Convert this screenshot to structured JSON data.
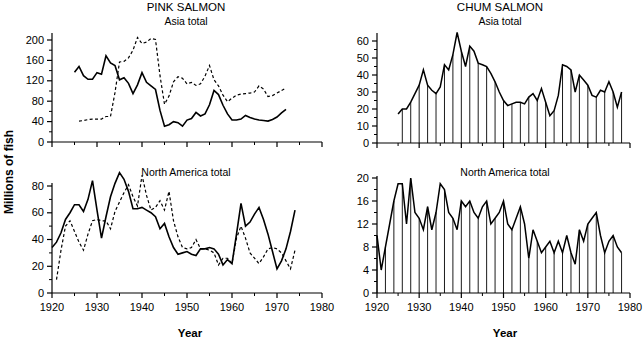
{
  "figure": {
    "ylabel": "Millions of fish",
    "xlabel_left": "Year",
    "xlabel_right": "Year"
  },
  "chart_data": [
    {
      "id": "pink-asia",
      "type": "line",
      "title": "PINK SALMON",
      "subtitle": "Asia total",
      "xlabel": "",
      "ylabel": "Millions of fish",
      "xlim": [
        1920,
        1980
      ],
      "ylim": [
        0,
        220
      ],
      "xticks": [
        1920,
        1930,
        1940,
        1950,
        1960,
        1970,
        1980
      ],
      "xticklabels": [
        "",
        "",
        "",
        "",
        "",
        "",
        ""
      ],
      "yticks": [
        0,
        40,
        80,
        120,
        160,
        200
      ],
      "yticklabels": [
        "0",
        "40",
        "80",
        "120",
        "160",
        "200"
      ],
      "minor_ticks": true,
      "grid": false,
      "legend": "none",
      "series": [
        {
          "name": "catch",
          "style": "solid",
          "x": [
            1925,
            1926,
            1927,
            1928,
            1929,
            1930,
            1931,
            1932,
            1933,
            1934,
            1935,
            1936,
            1937,
            1938,
            1939,
            1940,
            1941,
            1942,
            1943,
            1944,
            1945,
            1946,
            1947,
            1948,
            1949,
            1950,
            1951,
            1952,
            1953,
            1954,
            1955,
            1956,
            1957,
            1958,
            1959,
            1960,
            1961,
            1962,
            1963,
            1964,
            1965,
            1966,
            1967,
            1968,
            1969,
            1970,
            1971,
            1972,
            1973,
            1974,
            1975,
            1976,
            1977
          ],
          "values": [
            137,
            148,
            130,
            123,
            123,
            136,
            133,
            169,
            155,
            150,
            122,
            126,
            115,
            95,
            112,
            136,
            117,
            110,
            103,
            62,
            31,
            34,
            40,
            38,
            31,
            43,
            46,
            58,
            51,
            55,
            73,
            101,
            93,
            72,
            55,
            43,
            43,
            45,
            52,
            48,
            45,
            43,
            42,
            41,
            44,
            49,
            57,
            64,
            null,
            null,
            null,
            null,
            null
          ]
        },
        {
          "name": "escapement",
          "style": "dashed",
          "x": [
            1926,
            1927,
            1928,
            1929,
            1930,
            1931,
            1932,
            1933,
            1934,
            1935,
            1936,
            1937,
            1938,
            1939,
            1940,
            1941,
            1942,
            1943,
            1944,
            1945,
            1946,
            1947,
            1948,
            1949,
            1950,
            1951,
            1952,
            1953,
            1954,
            1955,
            1956,
            1957,
            1958,
            1959,
            1960,
            1961,
            1962,
            1963,
            1964,
            1965,
            1966,
            1967,
            1968,
            1969,
            1970,
            1971,
            1972
          ],
          "values": [
            41,
            42,
            44,
            45,
            45,
            45,
            50,
            50,
            97,
            157,
            158,
            165,
            180,
            205,
            193,
            196,
            203,
            201,
            130,
            74,
            90,
            118,
            128,
            125,
            114,
            117,
            111,
            114,
            129,
            150,
            122,
            110,
            92,
            79,
            86,
            92,
            94,
            95,
            96,
            98,
            110,
            104,
            89,
            91,
            96,
            101,
            106
          ]
        }
      ]
    },
    {
      "id": "chum-asia",
      "type": "line",
      "title": "CHUM SALMON",
      "subtitle": "Asia total",
      "xlabel": "",
      "ylabel": "Millions of fish",
      "xlim": [
        1920,
        1980
      ],
      "ylim": [
        0,
        67
      ],
      "xticks": [
        1920,
        1930,
        1940,
        1950,
        1960,
        1970,
        1980
      ],
      "xticklabels": [
        "",
        "",
        "",
        "",
        "",
        "",
        ""
      ],
      "yticks": [
        0,
        10,
        20,
        30,
        40,
        50,
        60
      ],
      "yticklabels": [
        "0",
        "10",
        "20",
        "30",
        "40",
        "50",
        "60"
      ],
      "minor_ticks": true,
      "grid": false,
      "dropline_interval": 2,
      "legend": "none",
      "series": [
        {
          "name": "catch",
          "style": "solid-droplines",
          "x": [
            1925,
            1926,
            1927,
            1928,
            1929,
            1930,
            1931,
            1932,
            1933,
            1934,
            1935,
            1936,
            1937,
            1938,
            1939,
            1940,
            1941,
            1942,
            1943,
            1944,
            1945,
            1946,
            1947,
            1948,
            1949,
            1950,
            1951,
            1952,
            1953,
            1954,
            1955,
            1956,
            1957,
            1958,
            1959,
            1960,
            1961,
            1962,
            1963,
            1964,
            1965,
            1966,
            1967,
            1968,
            1969,
            1970,
            1971,
            1972,
            1973,
            1974,
            1975,
            1976,
            1977,
            1978
          ],
          "values": [
            17,
            20,
            20,
            24,
            29,
            34,
            43,
            34,
            31,
            29,
            33,
            46,
            43,
            52,
            65,
            54,
            45,
            57,
            54,
            47,
            46,
            45,
            41,
            36,
            30,
            25,
            22,
            23,
            24,
            24,
            23,
            27,
            29,
            25,
            32,
            24,
            16,
            19,
            28,
            46,
            45,
            43,
            30,
            40,
            37,
            34,
            28,
            27,
            31,
            30,
            36,
            30,
            21,
            30
          ]
        }
      ]
    },
    {
      "id": "pink-na",
      "type": "line",
      "title": "",
      "subtitle": "North America total",
      "xlabel": "Year",
      "ylabel": "Millions of fish",
      "xlim": [
        1920,
        1980
      ],
      "ylim": [
        0,
        95
      ],
      "xticks": [
        1920,
        1930,
        1940,
        1950,
        1960,
        1970,
        1980
      ],
      "xticklabels": [
        "1920",
        "1930",
        "1940",
        "1950",
        "1960",
        "1970",
        "1980"
      ],
      "yticks": [
        0,
        20,
        40,
        60,
        80
      ],
      "yticklabels": [
        "0",
        "20",
        "40",
        "60",
        "80"
      ],
      "minor_ticks": true,
      "grid": false,
      "legend": "none",
      "series": [
        {
          "name": "catch",
          "style": "solid",
          "x": [
            1920,
            1921,
            1922,
            1923,
            1924,
            1925,
            1926,
            1927,
            1928,
            1929,
            1930,
            1931,
            1932,
            1933,
            1934,
            1935,
            1936,
            1937,
            1938,
            1939,
            1940,
            1941,
            1942,
            1943,
            1944,
            1945,
            1946,
            1947,
            1948,
            1949,
            1950,
            1951,
            1952,
            1953,
            1954,
            1955,
            1956,
            1957,
            1958,
            1959,
            1960,
            1961,
            1962,
            1963,
            1964,
            1965,
            1966,
            1967,
            1968,
            1969,
            1970,
            1971,
            1972,
            1973,
            1974,
            1975,
            1976,
            1977,
            1978
          ],
          "values": [
            34,
            38,
            45,
            55,
            60,
            66,
            66,
            61,
            70,
            84,
            62,
            41,
            57,
            72,
            82,
            90,
            85,
            76,
            63,
            63,
            64,
            62,
            60,
            57,
            48,
            52,
            42,
            34,
            29,
            30,
            31,
            29,
            28,
            33,
            33,
            34,
            33,
            29,
            21,
            25,
            22,
            44,
            67,
            50,
            53,
            59,
            64,
            55,
            44,
            31,
            18,
            24,
            33,
            46,
            62,
            null,
            null,
            null,
            null
          ]
        },
        {
          "name": "escapement",
          "style": "dashed",
          "x": [
            1921,
            1922,
            1923,
            1924,
            1925,
            1926,
            1927,
            1928,
            1929,
            1930,
            1931,
            1932,
            1933,
            1934,
            1935,
            1936,
            1937,
            1938,
            1939,
            1940,
            1941,
            1942,
            1943,
            1944,
            1945,
            1946,
            1947,
            1948,
            1949,
            1950,
            1951,
            1952,
            1953,
            1954,
            1955,
            1956,
            1957,
            1958,
            1959,
            1960,
            1961,
            1962,
            1963,
            1964,
            1965,
            1966,
            1967,
            1968,
            1969,
            1970,
            1971,
            1972,
            1973,
            1974
          ],
          "values": [
            10,
            32,
            50,
            54,
            46,
            38,
            32,
            44,
            54,
            55,
            54,
            54,
            48,
            61,
            68,
            75,
            81,
            72,
            65,
            88,
            73,
            62,
            64,
            69,
            62,
            76,
            54,
            42,
            34,
            33,
            34,
            40,
            33,
            33,
            32,
            30,
            21,
            26,
            26,
            22,
            41,
            50,
            41,
            30,
            26,
            22,
            27,
            33,
            34,
            33,
            30,
            24,
            18,
            32
          ]
        }
      ]
    },
    {
      "id": "chum-na",
      "type": "line",
      "title": "",
      "subtitle": "North America total",
      "xlabel": "Year",
      "ylabel": "Millions of fish",
      "xlim": [
        1920,
        1980
      ],
      "ylim": [
        0,
        21
      ],
      "xticks": [
        1920,
        1930,
        1940,
        1950,
        1960,
        1970,
        1980
      ],
      "xticklabels": [
        "1920",
        "1930",
        "1940",
        "1950",
        "1960",
        "1970",
        "1980"
      ],
      "yticks": [
        0,
        4,
        8,
        12,
        16,
        20
      ],
      "yticklabels": [
        "0",
        "4",
        "8",
        "12",
        "16",
        "20"
      ],
      "minor_ticks": true,
      "grid": false,
      "dropline_interval": 2,
      "legend": "none",
      "series": [
        {
          "name": "catch",
          "style": "solid-droplines",
          "x": [
            1920,
            1921,
            1922,
            1923,
            1924,
            1925,
            1926,
            1927,
            1928,
            1929,
            1930,
            1931,
            1932,
            1933,
            1934,
            1935,
            1936,
            1937,
            1938,
            1939,
            1940,
            1941,
            1942,
            1943,
            1944,
            1945,
            1946,
            1947,
            1948,
            1949,
            1950,
            1951,
            1952,
            1953,
            1954,
            1955,
            1956,
            1957,
            1958,
            1959,
            1960,
            1961,
            1962,
            1963,
            1964,
            1965,
            1966,
            1967,
            1968,
            1969,
            1970,
            1971,
            1972,
            1973,
            1974,
            1975,
            1976,
            1977,
            1978
          ],
          "values": [
            10,
            4,
            8,
            12,
            16,
            19,
            19,
            12,
            20,
            14,
            13,
            11,
            15,
            11,
            14,
            19,
            18,
            14,
            13,
            11,
            16,
            15,
            16,
            14,
            13,
            15,
            16,
            12,
            13,
            14,
            16,
            12,
            11,
            13,
            15,
            12,
            6,
            11,
            9,
            7,
            8,
            9,
            7,
            9,
            7,
            10,
            7,
            5,
            11,
            9,
            12,
            13,
            14,
            10,
            7,
            9,
            10,
            8,
            7
          ]
        }
      ]
    }
  ]
}
